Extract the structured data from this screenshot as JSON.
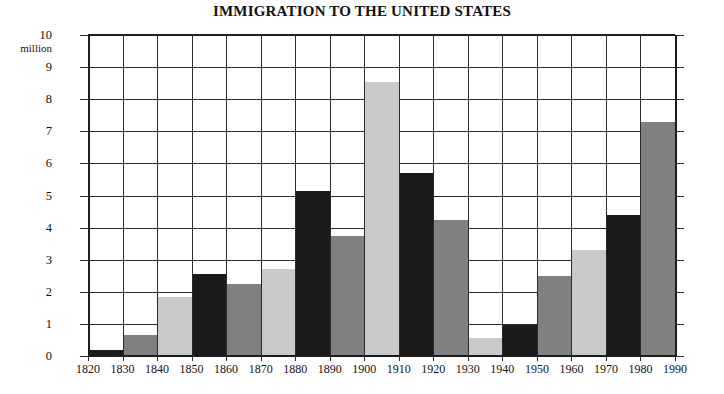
{
  "chart": {
    "title": "IMMIGRATION TO THE UNITED STATES",
    "y_unit_label": "million"
  },
  "chart_data": {
    "type": "bar",
    "title": "IMMIGRATION TO THE UNITED STATES",
    "xlabel": "",
    "ylabel": "million",
    "ylim": [
      0,
      10
    ],
    "xlim": [
      1820,
      1990
    ],
    "grid": true,
    "legend": "none",
    "y_ticks": [
      0,
      1,
      2,
      3,
      4,
      5,
      6,
      7,
      8,
      9,
      10
    ],
    "x_ticks": [
      1820,
      1830,
      1840,
      1850,
      1860,
      1870,
      1880,
      1890,
      1900,
      1910,
      1920,
      1930,
      1940,
      1950,
      1960,
      1970,
      1980,
      1990
    ],
    "categories": [
      "1820",
      "1830",
      "1840",
      "1850",
      "1860",
      "1870",
      "1880",
      "1890",
      "1900",
      "1910",
      "1920",
      "1930",
      "1940",
      "1950",
      "1960",
      "1970",
      "1980"
    ],
    "values": [
      0.2,
      0.65,
      1.85,
      2.55,
      2.25,
      2.7,
      5.15,
      3.75,
      8.55,
      5.7,
      4.25,
      0.55,
      0.98,
      2.5,
      3.3,
      4.4,
      7.3
    ],
    "bar_colors": [
      "#1a1a1a",
      "#808080",
      "#c9c9c9",
      "#1a1a1a",
      "#808080",
      "#c9c9c9",
      "#1a1a1a",
      "#808080",
      "#c9c9c9",
      "#1a1a1a",
      "#808080",
      "#c9c9c9",
      "#1a1a1a",
      "#808080",
      "#c9c9c9",
      "#1a1a1a",
      "#808080"
    ],
    "bars": [
      {
        "decade": "1820",
        "value": 0.2,
        "color": "#1a1a1a"
      },
      {
        "decade": "1830",
        "value": 0.65,
        "color": "#808080"
      },
      {
        "decade": "1840",
        "value": 1.85,
        "color": "#c9c9c9"
      },
      {
        "decade": "1850",
        "value": 2.55,
        "color": "#1a1a1a"
      },
      {
        "decade": "1860",
        "value": 2.25,
        "color": "#808080"
      },
      {
        "decade": "1870",
        "value": 2.7,
        "color": "#c9c9c9"
      },
      {
        "decade": "1880",
        "value": 5.15,
        "color": "#1a1a1a"
      },
      {
        "decade": "1890",
        "value": 3.75,
        "color": "#808080"
      },
      {
        "decade": "1900",
        "value": 8.55,
        "color": "#c9c9c9"
      },
      {
        "decade": "1910",
        "value": 5.7,
        "color": "#1a1a1a"
      },
      {
        "decade": "1920",
        "value": 4.25,
        "color": "#808080"
      },
      {
        "decade": "1930",
        "value": 0.55,
        "color": "#c9c9c9"
      },
      {
        "decade": "1940",
        "value": 0.98,
        "color": "#1a1a1a"
      },
      {
        "decade": "1950",
        "value": 2.5,
        "color": "#808080"
      },
      {
        "decade": "1960",
        "value": 3.3,
        "color": "#c9c9c9"
      },
      {
        "decade": "1970",
        "value": 4.4,
        "color": "#1a1a1a"
      },
      {
        "decade": "1980",
        "value": 7.3,
        "color": "#808080"
      }
    ],
    "colors": {
      "bar_dark": "#1a1a1a",
      "bar_mid": "#808080",
      "bar_light": "#c9c9c9",
      "grid": "#2b2b2b",
      "axis": "#1d1d1d",
      "text": "#111111",
      "background": "#ffffff"
    }
  }
}
